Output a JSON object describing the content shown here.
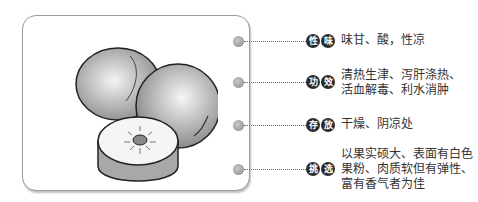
{
  "items": [
    {
      "badge": [
        "性",
        "味"
      ],
      "label": "性味",
      "lines": [
        "味甘、酸，性凉"
      ]
    },
    {
      "badge": [
        "功",
        "效"
      ],
      "label": "功效",
      "lines": [
        "清热生津、泻肝涤热、",
        "活血解毒、利水消肿"
      ]
    },
    {
      "badge": [
        "存",
        "放"
      ],
      "label": "存放",
      "lines": [
        "干燥、阴凉处"
      ]
    },
    {
      "badge": [
        "挑",
        "选"
      ],
      "label": "挑选",
      "lines": [
        "以果实硕大、表面有白色",
        "果粉、肉质软但有弹性、",
        "富有香气者为佳"
      ]
    }
  ],
  "colors": {
    "badge_bg": "#2b2b2b",
    "badge_text": "#ffffff",
    "dot": "#a0a0a0",
    "card_border": "#9a9a9a"
  }
}
